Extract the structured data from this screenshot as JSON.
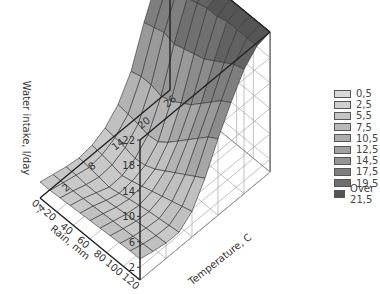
{
  "chart_data": {
    "type": "surface3d",
    "title": "",
    "xlabel": "Temperature, C",
    "ylabel": "Rain, mm",
    "zlabel": "Water intake, l/day",
    "x_ticks": [
      "-4",
      "2",
      "8",
      "14",
      "20",
      "26"
    ],
    "y_ticks": [
      "0",
      "20",
      "40",
      "60",
      "80",
      "100",
      "120"
    ],
    "z_ticks": [
      "2",
      "6",
      "10",
      "14",
      "18",
      "22"
    ],
    "xlim": [
      -4,
      26
    ],
    "ylim": [
      0,
      120
    ],
    "zlim": [
      0,
      22
    ],
    "x": [
      -4,
      -1,
      2,
      5,
      8,
      11,
      14,
      17,
      20,
      23,
      26
    ],
    "y": [
      0,
      12,
      24,
      36,
      48,
      60,
      72,
      84,
      96,
      108,
      120
    ],
    "z_rows_by_rain": [
      [
        2.5,
        2.0,
        1.5,
        1.2,
        1.5,
        2.5,
        4.5,
        8.0,
        14.0,
        19.0,
        21.5
      ],
      [
        2.5,
        2.0,
        1.5,
        1.0,
        1.3,
        2.3,
        4.3,
        8.5,
        14.5,
        19.5,
        21.5
      ],
      [
        2.6,
        2.0,
        1.3,
        0.8,
        1.0,
        2.0,
        4.0,
        8.5,
        15.0,
        20.0,
        22.0
      ],
      [
        2.7,
        2.1,
        1.3,
        0.5,
        0.6,
        1.6,
        3.6,
        8.0,
        14.5,
        20.0,
        22.0
      ],
      [
        2.8,
        2.2,
        1.4,
        0.8,
        1.0,
        1.8,
        3.8,
        8.5,
        15.0,
        20.5,
        22.0
      ],
      [
        2.9,
        2.3,
        1.6,
        1.2,
        1.5,
        2.5,
        5.0,
        9.5,
        15.5,
        21.0,
        22.0
      ],
      [
        3.0,
        2.4,
        1.8,
        1.5,
        2.0,
        3.5,
        6.5,
        10.5,
        16.0,
        21.0,
        22.0
      ],
      [
        3.1,
        2.5,
        2.0,
        1.8,
        2.5,
        4.5,
        8.0,
        12.0,
        17.0,
        21.5,
        22.0
      ],
      [
        3.2,
        2.6,
        2.2,
        2.0,
        3.0,
        5.5,
        9.5,
        13.5,
        18.0,
        21.5,
        22.0
      ],
      [
        3.3,
        2.7,
        2.3,
        2.2,
        3.5,
        6.5,
        11.0,
        15.0,
        19.0,
        21.5,
        22.0
      ],
      [
        3.3,
        2.8,
        2.4,
        2.4,
        4.0,
        7.5,
        12.0,
        16.0,
        19.5,
        21.5,
        22.0
      ]
    ],
    "legend": {
      "position": "right",
      "entries": [
        "0,5",
        "2,5",
        "5,5",
        "7,5",
        "10,5",
        "12,5",
        "14,5",
        "17,5",
        "19,5",
        "Over 21,5"
      ],
      "colors": [
        "#d9d9d9",
        "#cfcfcf",
        "#c4c4c4",
        "#b9b9b9",
        "#adadad",
        "#a1a1a1",
        "#959595",
        "#7f7f7f",
        "#6f6f6f",
        "#555555"
      ]
    },
    "grid": true
  }
}
